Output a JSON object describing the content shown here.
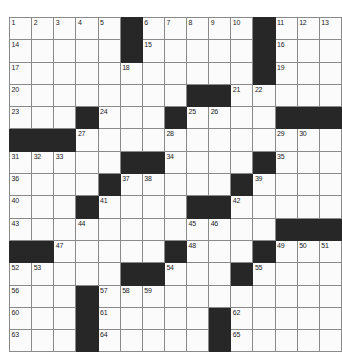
{
  "puzzle": {
    "kind": "crossword-grid",
    "rows": 15,
    "cols": 15,
    "cell_size_px": 22,
    "colors": {
      "block": "#272727",
      "cell": "#fbfbfb",
      "grid_line": "#8a8a8a",
      "border": "#5a5a5a",
      "number_text": "#1c1c1c"
    },
    "grid": [
      [
        "1",
        "2",
        "3",
        "4",
        "5",
        "#",
        "6",
        "7",
        "8",
        "9",
        "10",
        "#",
        "11",
        "12",
        "13"
      ],
      [
        "14",
        "",
        "",
        "",
        "",
        "#",
        "15",
        "",
        "",
        "",
        "",
        "#",
        "16",
        "",
        ""
      ],
      [
        "17",
        "",
        "",
        "",
        "",
        "18",
        "",
        "",
        "",
        "",
        "",
        "#",
        "19",
        "",
        ""
      ],
      [
        "20",
        "",
        "",
        "",
        "",
        "",
        "",
        "",
        "#",
        "#",
        "21",
        "22",
        "",
        "",
        ""
      ],
      [
        "23",
        "",
        "",
        "#",
        "24",
        "",
        "",
        "#",
        "25",
        "26",
        "",
        "",
        "#",
        "#",
        "#"
      ],
      [
        "#",
        "#",
        "#",
        "27",
        "",
        "",
        "",
        "28",
        "",
        "",
        "",
        "",
        "29",
        "30",
        ""
      ],
      [
        "31",
        "32",
        "33",
        "",
        "",
        "#",
        "#",
        "34",
        "",
        "",
        "",
        "#",
        "35",
        "",
        ""
      ],
      [
        "36",
        "",
        "",
        "",
        "#",
        "37",
        "38",
        "",
        "",
        "",
        "#",
        "39",
        "",
        "",
        ""
      ],
      [
        "40",
        "",
        "",
        "#",
        "41",
        "",
        "",
        "",
        "#",
        "#",
        "42",
        "",
        "",
        "",
        ""
      ],
      [
        "43",
        "",
        "",
        "44",
        "",
        "",
        "",
        "",
        "45",
        "46",
        "",
        "",
        "#",
        "#",
        "#"
      ],
      [
        "#",
        "#",
        "47",
        "",
        "",
        "",
        "",
        "#",
        "48",
        "",
        "",
        "#",
        "49",
        "50",
        "51"
      ],
      [
        "52",
        "53",
        "",
        "",
        "",
        "#",
        "#",
        "54",
        "",
        "",
        "#",
        "55",
        "",
        "",
        ""
      ],
      [
        "56",
        "",
        "",
        "#",
        "57",
        "58",
        "59",
        "",
        "",
        "",
        "",
        "",
        "",
        "",
        ""
      ],
      [
        "60",
        "",
        "",
        "#",
        "61",
        "",
        "",
        "",
        "",
        "#",
        "62",
        "",
        "",
        "",
        ""
      ],
      [
        "63",
        "",
        "",
        "#",
        "64",
        "",
        "",
        "",
        "",
        "#",
        "65",
        "",
        "",
        "",
        ""
      ]
    ],
    "max_clue_number": 65
  }
}
